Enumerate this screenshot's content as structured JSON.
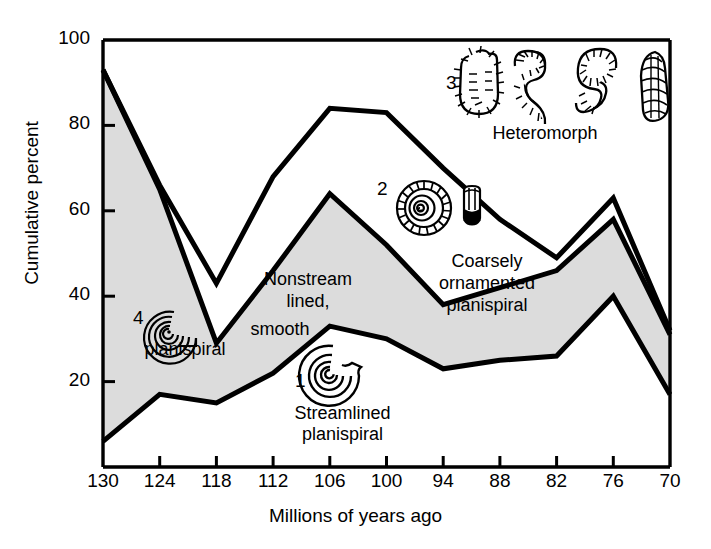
{
  "chart_data": {
    "type": "area",
    "title": "",
    "xlabel": "Millions of years ago",
    "ylabel": "Cumulative percent",
    "xlim": [
      130,
      70
    ],
    "ylim": [
      0,
      100
    ],
    "x_reversed": true,
    "grid": false,
    "legend_position": "inline-annotations",
    "xticks": [
      130,
      124,
      118,
      112,
      106,
      100,
      94,
      88,
      82,
      76,
      70
    ],
    "yticks": [
      20,
      40,
      60,
      80,
      100
    ],
    "x": [
      130,
      124,
      118,
      112,
      106,
      100,
      94,
      88,
      82,
      76,
      70
    ],
    "series": [
      {
        "name": "Streamlined planispiral",
        "key": "lower",
        "fill": "white",
        "cumulative_values": [
          6,
          17,
          15,
          22,
          33,
          30,
          23,
          25,
          26,
          40,
          17
        ]
      },
      {
        "name": "Nonstreamlined, smooth planispiral",
        "key": "middle",
        "fill": "#dcdcdc",
        "cumulative_values": [
          93,
          65,
          29,
          46,
          64,
          52,
          38,
          42,
          46,
          58,
          31
        ]
      },
      {
        "name": "Coarsely ornamented planispiral",
        "key": "upper",
        "fill": "white",
        "cumulative_values": [
          93,
          66,
          43,
          68,
          84,
          83,
          70,
          58,
          49,
          63,
          32
        ]
      },
      {
        "name": "Heteromorph",
        "key": "top",
        "fill": "white",
        "cumulative_values": [
          100,
          100,
          100,
          100,
          100,
          100,
          100,
          100,
          100,
          100,
          100
        ]
      }
    ]
  },
  "axes": {
    "y_title": "Cumulative percent",
    "x_title": "Millions of years ago",
    "x_tick_labels": [
      "130",
      "124",
      "118",
      "112",
      "106",
      "100",
      "94",
      "88",
      "82",
      "76",
      "70"
    ],
    "y_tick_labels": [
      "20",
      "40",
      "60",
      "80",
      "100"
    ]
  },
  "annotations": {
    "band1": {
      "number": "1",
      "line1": "Streamlined",
      "line2": "planispiral",
      "icon": "smooth-planispiral-shell-icon"
    },
    "band2": {
      "number": "2",
      "line1": "Coarsely",
      "line2": "ornamented",
      "line3": "planispiral",
      "icon": "ribbed-planispiral-shell-icon"
    },
    "band3": {
      "number": "3",
      "line1": "Heteromorph",
      "icon": "heteromorph-shells-icon"
    },
    "band4": {
      "number": "4",
      "line1": "Nonstream",
      "line2": "lined,",
      "line3": "smooth",
      "line4": "planispiral",
      "icon": "spiral-coil-shell-icon"
    }
  },
  "colors": {
    "shaded_band": "#dcdcdc",
    "line": "#000000",
    "background": "#ffffff"
  }
}
